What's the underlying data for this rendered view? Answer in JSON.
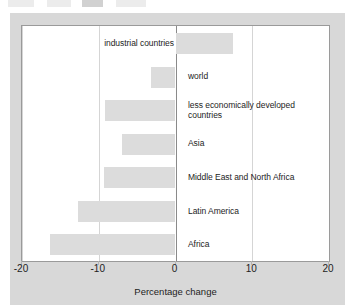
{
  "figure": {
    "background_color": "#d8d8d8",
    "plot_background_color": "#ffffff",
    "bar_color": "#dcdcdc",
    "gridline_color": "#d5d5d5",
    "zero_line_color": "#8a8a8a"
  },
  "top_artifact": {
    "description": "cropped-toolbar-fragments"
  },
  "chart_data": {
    "type": "bar",
    "orientation": "horizontal",
    "title": "",
    "subtitle": "",
    "xlabel": "Percentage change",
    "ylabel": "",
    "xlim": [
      -20,
      20
    ],
    "xticks": [
      -20,
      -10,
      0,
      10,
      20
    ],
    "xtick_labels": [
      "-20",
      "-10",
      "0",
      "10",
      "20"
    ],
    "grid": true,
    "grid_axis": "x",
    "legend": false,
    "legend_position": "none",
    "categories": [
      "industrial countries",
      "world",
      "less economically developed countries",
      "Asia",
      "Middle East and North Africa",
      "Latin America",
      "Africa"
    ],
    "values": [
      7.5,
      -3.2,
      -9.2,
      -7.0,
      -9.3,
      -12.7,
      -16.4
    ],
    "bars": [
      {
        "label": "industrial countries",
        "label_lines": [
          "industrial countries"
        ],
        "value": 7.5,
        "label_side": "left"
      },
      {
        "label": "world",
        "label_lines": [
          "world"
        ],
        "value": -3.2,
        "label_side": "right"
      },
      {
        "label": "less economically developed countries",
        "label_lines": [
          "less economically developed",
          "countries"
        ],
        "value": -9.2,
        "label_side": "right"
      },
      {
        "label": "Asia",
        "label_lines": [
          "Asia"
        ],
        "value": -7.0,
        "label_side": "right"
      },
      {
        "label": "Middle East and North Africa",
        "label_lines": [
          "Middle East and North Africa"
        ],
        "value": -9.3,
        "label_side": "right"
      },
      {
        "label": "Latin America",
        "label_lines": [
          "Latin America"
        ],
        "value": -12.7,
        "label_side": "right"
      },
      {
        "label": "Africa",
        "label_lines": [
          "Africa"
        ],
        "value": -16.4,
        "label_side": "right"
      }
    ]
  }
}
